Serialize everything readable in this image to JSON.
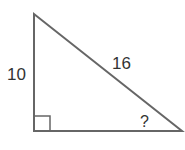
{
  "diagram": {
    "type": "right-triangle",
    "labels": {
      "vertical_leg": "10",
      "hypotenuse": "16",
      "angle": "?"
    },
    "colors": {
      "stroke": "#666666",
      "text": "#333333"
    }
  }
}
